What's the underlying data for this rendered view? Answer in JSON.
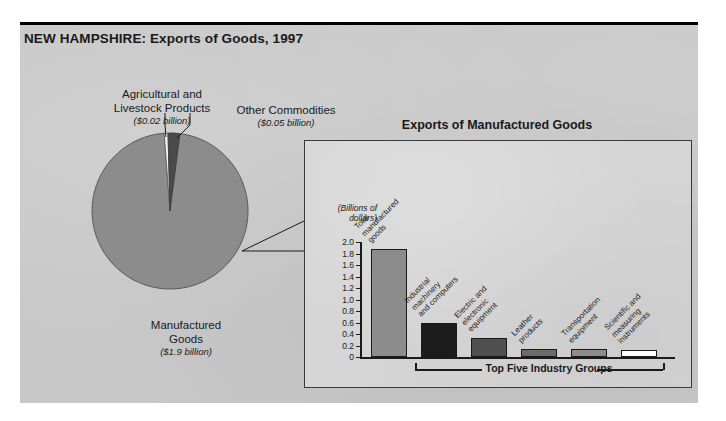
{
  "figure": {
    "title": "NEW HAMPSHIRE: Exports of Goods, 1997"
  },
  "pie_labels": {
    "agricultural": {
      "name": "Agricultural and\nLivestock Products",
      "line1": "Agricultural and",
      "line2": "Livestock Products",
      "value": "($0.02 billion)"
    },
    "other": {
      "line1": "Other Commodities",
      "value": "($0.05 billion)"
    },
    "manufactured": {
      "line1": "Manufactured",
      "line2": "Goods",
      "value": "($1.9 billion)"
    }
  },
  "panel": {
    "title": "Exports of Manufactured Goods",
    "axis_unit_line1": "(Billions of",
    "axis_unit_line2": "dollars)",
    "bracket_label": "Top Five Industry Groups"
  },
  "chart_data": [
    {
      "type": "pie",
      "title": "NEW HAMPSHIRE: Exports of Goods, 1997",
      "labels": [
        "Manufactured Goods",
        "Agricultural and Livestock Products",
        "Other Commodities"
      ],
      "values": [
        1.9,
        0.02,
        0.05
      ],
      "value_labels": [
        "($1.9 billion)",
        "($0.02 billion)",
        "($0.05 billion)"
      ],
      "unit": "billions of dollars",
      "colors": [
        "#8c8c8c",
        "#f2f2f2",
        "#4a4a4a"
      ],
      "legend": "labels-with-leader-lines"
    },
    {
      "type": "bar",
      "title": "Exports of Manufactured Goods",
      "ylabel": "(Billions of dollars)",
      "xlabel": "",
      "ylim": [
        0,
        2.0
      ],
      "yticks": [
        "0",
        "0.2",
        "0.4",
        "0.6",
        "0.8",
        "1.0",
        "1.2",
        "1.4",
        "1.6",
        "1.8",
        "2.0"
      ],
      "grid": false,
      "categories": [
        "Total manufactured goods",
        "Industrial machinery and computers",
        "Electric and electronic equipment",
        "Leather products",
        "Transportation equipment",
        "Scientific and measuring instruments"
      ],
      "category_lines": [
        [
          "Total",
          "manufactured",
          "goods"
        ],
        [
          "Industrial",
          "machinery",
          "and computers"
        ],
        [
          "Electric and",
          "electronic",
          "equipment"
        ],
        [
          "Leather",
          "products"
        ],
        [
          "Transportation",
          "equipment"
        ],
        [
          "Scientific and",
          "measuring",
          "instruments"
        ]
      ],
      "values": [
        1.87,
        0.6,
        0.33,
        0.14,
        0.14,
        0.13
      ],
      "colors": [
        "#8c8c8c",
        "#1c1c1c",
        "#4f4f4f",
        "#6b6b6b",
        "#8c8c8c",
        "#ffffff"
      ],
      "annotation": "Top Five Industry Groups"
    }
  ]
}
